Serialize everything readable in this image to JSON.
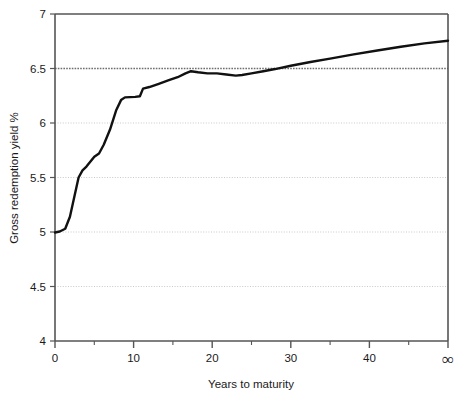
{
  "chart_data": {
    "type": "line",
    "title": "",
    "xlabel": "Years to maturity",
    "ylabel": "Gross redemption yield %",
    "xlim": [
      0,
      50
    ],
    "ylim": [
      4,
      7
    ],
    "grid": true,
    "legend": false,
    "x_tick_labels": [
      "0",
      "10",
      "20",
      "30",
      "40",
      "∞"
    ],
    "x_tick_values": [
      0,
      10,
      20,
      30,
      40,
      50
    ],
    "x_minor_tick_values": [
      5,
      15,
      25,
      35,
      45
    ],
    "y_tick_labels": [
      "4",
      "4.5",
      "5",
      "5.5",
      "6",
      "6.5",
      "7"
    ],
    "y_tick_values": [
      4,
      4.5,
      5,
      5.5,
      6,
      6.5,
      7
    ],
    "series": [
      {
        "name": "Gross redemption yield",
        "color": "#111111",
        "x": [
          0,
          0.6,
          1.3,
          1.9,
          3.0,
          3.5,
          4.0,
          5.0,
          5.6,
          6.2,
          7.0,
          7.8,
          8.4,
          8.9,
          10.2,
          10.8,
          11.2,
          12.0,
          13.2,
          14.4,
          15.6,
          16.6,
          17.3,
          18.2,
          19.4,
          20.6,
          21.8,
          23.0,
          23.8,
          25.0,
          26.5,
          28.0,
          30.0,
          32.5,
          35.0,
          38.0,
          41.0,
          44.0,
          47.0,
          50.0
        ],
        "y": [
          4.995,
          5.005,
          5.03,
          5.14,
          5.5,
          5.565,
          5.6,
          5.69,
          5.72,
          5.8,
          5.94,
          6.12,
          6.21,
          6.235,
          6.24,
          6.245,
          6.315,
          6.33,
          6.36,
          6.39,
          6.42,
          6.455,
          6.475,
          6.465,
          6.455,
          6.455,
          6.445,
          6.435,
          6.44,
          6.455,
          6.475,
          6.495,
          6.525,
          6.56,
          6.59,
          6.63,
          6.665,
          6.7,
          6.73,
          6.755
        ]
      }
    ],
    "gridline_style": {
      "normal_color": "#c9c9c9",
      "emphasis_value": 6.5,
      "emphasis_color": "#6e6e6e"
    },
    "axis_color": "#555555",
    "background": "#ffffff"
  },
  "labels": {
    "x_axis_title": "Years to maturity",
    "y_axis_title": "Gross redemption yield %"
  }
}
